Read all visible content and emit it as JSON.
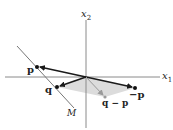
{
  "diagram": {
    "axes": {
      "x1_label": "x",
      "x1_sub": "1",
      "x2_label": "x",
      "x2_sub": "2"
    },
    "points": {
      "p": {
        "label": "p"
      },
      "q": {
        "label": "q"
      },
      "neg_p": {
        "label": "−p"
      },
      "q_minus_p": {
        "label": "q − p"
      }
    },
    "line": {
      "label": "M"
    },
    "colors": {
      "axis": "#888888",
      "vector": "#1a1a1a",
      "shade": "#d9d9d9",
      "line_m": "#777777",
      "q_minus_p_vector": "#9a9a9a"
    }
  }
}
